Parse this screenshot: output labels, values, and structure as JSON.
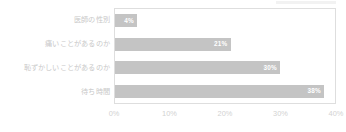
{
  "chart_data": {
    "type": "bar",
    "orientation": "horizontal",
    "title": "",
    "subtitle": "",
    "xlabel": "",
    "ylabel": "",
    "categories": [
      "医師の性別",
      "痛いことがあるのか",
      "恥ずかしいことがあるのか",
      "待ち時間"
    ],
    "values": [
      4,
      21,
      30,
      38
    ],
    "value_labels": [
      "4%",
      "21%",
      "30%",
      "38%"
    ],
    "xlim": [
      0,
      40
    ],
    "xticks": [
      0,
      10,
      20,
      30,
      40
    ],
    "xtick_labels": [
      "0%",
      "10%",
      "20%",
      "30%",
      "40%"
    ],
    "grid": false,
    "legend": false,
    "series": [
      {
        "name": "",
        "values": [
          4,
          21,
          30,
          38
        ]
      }
    ]
  },
  "style": {
    "bar_color": "#c4c4c4",
    "value_label_color": "#ffffff",
    "category_label_color": "#c9c9c9",
    "tick_label_color": "#d2d2d2",
    "plot_border_color": "#dedede",
    "background_color": "#ffffff"
  }
}
